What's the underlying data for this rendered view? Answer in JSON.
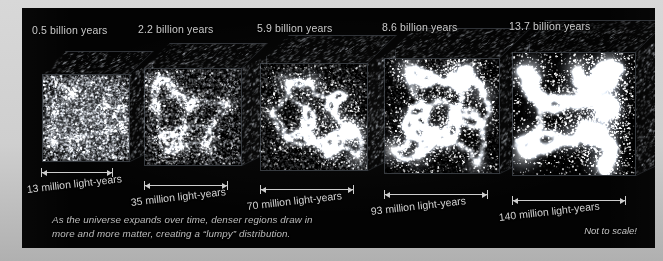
{
  "figure": {
    "caption_line1": "As the universe expands over time, denser regions draw in",
    "caption_line2": "more and more matter, creating a “lumpy” distribution.",
    "note": "Not to scale!",
    "background_color": "#030303",
    "text_color": "#c9c9c9",
    "rule_color": "#cdcdcd"
  },
  "chart_data": {
    "type": "diagram-series",
    "xlabel": "Cosmic time",
    "ylabel": "Comoving box size",
    "legend": [],
    "grid": false,
    "panels": [
      {
        "time_label": "0.5 billion years",
        "age_gyr": 0.5,
        "scale_label": "13 million light-years",
        "scale_value": 13,
        "scale_unit": "million light-years",
        "clumpiness": 0.08,
        "box_px": 88
      },
      {
        "time_label": "2.2 billion years",
        "age_gyr": 2.2,
        "scale_label": "35 million light-years",
        "scale_value": 35,
        "scale_unit": "million light-years",
        "clumpiness": 0.33,
        "box_px": 98
      },
      {
        "time_label": "5.9 billion years",
        "age_gyr": 5.9,
        "scale_label": "70 million light-years",
        "scale_value": 70,
        "scale_unit": "million light-years",
        "clumpiness": 0.56,
        "box_px": 108
      },
      {
        "time_label": "8.6 billion years",
        "age_gyr": 8.6,
        "scale_label": "93 million light-years",
        "scale_value": 93,
        "scale_unit": "million light-years",
        "clumpiness": 0.78,
        "box_px": 116
      },
      {
        "time_label": "13.7 billion years",
        "age_gyr": 13.7,
        "scale_label": "140 million light-years",
        "scale_value": 140,
        "scale_unit": "million light-years",
        "clumpiness": 1.0,
        "box_px": 124
      }
    ]
  }
}
